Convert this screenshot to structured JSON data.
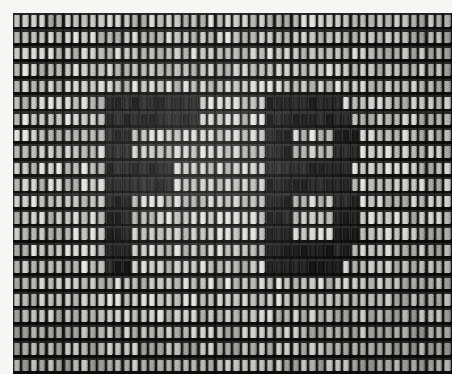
{
  "image": {
    "kind": "micrograph",
    "subject_label": "display-pixel-array",
    "rendered_text": "FB",
    "background_color": "#f6f6f4",
    "array_dark_color": "#15140f",
    "array_bright_color": "#e8e8e4",
    "array_mid_color": "#8a8a86"
  },
  "array": {
    "columns": 52,
    "rows": 22,
    "origin_x": 13,
    "origin_y": 13,
    "width": 439,
    "height": 361,
    "cell_width": 8.4,
    "cell_height": 16.4
  },
  "legend": {
    "on_state_label": "bright-cell",
    "off_state_label": "dark-cell"
  },
  "glyph_map": {
    "description": "22 rows x 52 columns. 1 = dark (off) cell forming the glyph, 0 = bright (on) cell.",
    "rows": [
      "0000000000000000000000000000000000000000000000000000",
      "0000000000000000000000000000000000000000000000000000",
      "0000000000000000000000000000000000000000000000000000",
      "0000000000000000000000000000000000000000000000000000",
      "0000000000000000000000000000000000000000000000000000",
      "0000000000011111111111000000001111111110000000000000",
      "0000000000011111111111000000001111111111000000000000",
      "0000000000011100000000000000001110000011100000000000",
      "0000000000011100000000000000001110000011100000000000",
      "0000000000011111111000000000001111111111000000000000",
      "0000000000011111111000000000001111111111000000000000",
      "0000000000011100000000000000001110000011100000000000",
      "0000000000011100000000000000001110000011100000000000",
      "0000000000011100000000000000001110000011100000000000",
      "0000000000011100000000000000001111111111000000000000",
      "0000000000011100000000000000001111111110000000000000",
      "0000000000000000000000000000000000000000000000000000",
      "0000000000000000000000000000000000000000000000000000",
      "0000000000000000000000000000000000000000000000000000",
      "0000000000000000000000000000000000000000000000000000",
      "0000000000000000000000000000000000000000000000000000",
      "0000000000000000000000000000000000000000000000000000"
    ]
  }
}
